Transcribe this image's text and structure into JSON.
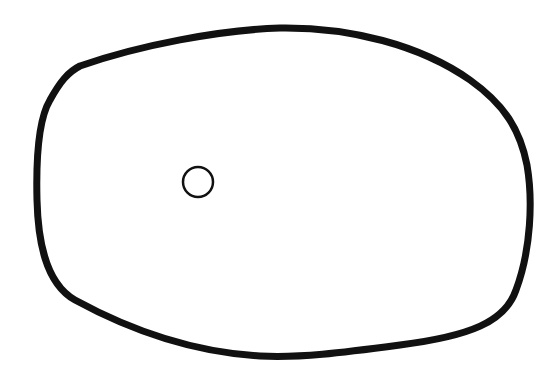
{
  "diagram": {
    "background": "#ffffff",
    "outer_shape": {
      "type": "closed-irregular-outline",
      "stroke": "#111111",
      "stroke_width": 7,
      "fill": "none",
      "path": "M 80 66 C 140 45, 220 30, 280 28 C 350 27, 420 45, 470 80 C 505 105, 520 130, 527 165 C 533 200, 531 250, 516 290 C 505 322, 470 336, 400 345 C 340 353, 300 358, 260 356 C 190 352, 130 330, 75 300 C 45 283, 38 240, 37 200 C 36 160, 38 120, 50 100 C 60 82, 68 72, 80 66 Z"
    },
    "inner_circle": {
      "type": "circle",
      "cx": 198,
      "cy": 182,
      "r": 15,
      "stroke": "#111111",
      "stroke_width": 2.5,
      "fill": "none"
    }
  }
}
